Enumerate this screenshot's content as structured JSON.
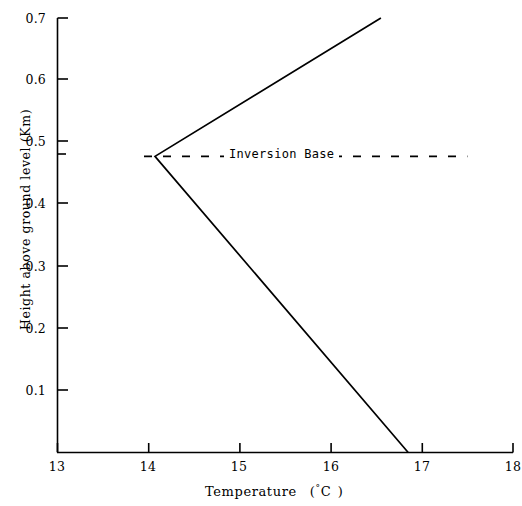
{
  "chart_data": {
    "type": "line",
    "title": "",
    "xlabel": "Temperature  (°C )",
    "ylabel": "Height above ground level (Km)",
    "xlim": [
      13,
      18
    ],
    "ylim": [
      0,
      0.7
    ],
    "grid": false,
    "legend_position": "none",
    "xticks": [
      "13",
      "14",
      "15",
      "16",
      "17",
      "18"
    ],
    "xtick_values": [
      13,
      14,
      15,
      16,
      17,
      18
    ],
    "yticks": [
      "0.1",
      "0.2",
      "0.3",
      "0.4",
      "0.5",
      "0.6",
      "0.7"
    ],
    "ytick_values": [
      0.1,
      0.2,
      0.3,
      0.4,
      0.5,
      0.6,
      0.7
    ],
    "series": [
      {
        "name": "Temperature profile",
        "style": "solid",
        "x": [
          16.85,
          14.07,
          16.55
        ],
        "y": [
          0.0,
          0.477,
          0.7
        ]
      },
      {
        "name": "Inversion Base",
        "style": "dashed",
        "x": [
          13.95,
          17.5
        ],
        "y": [
          0.477,
          0.477
        ]
      }
    ],
    "annotations": [
      {
        "text": "Inversion Base",
        "x": 15.4,
        "y": 0.477
      }
    ],
    "extra_yticks": [
      0.477
    ]
  },
  "axis": {
    "x_title_main": "Temperature",
    "x_title_unit_open": "(",
    "x_title_degree": "°",
    "x_title_c": "C",
    "x_title_unit_close": ")",
    "y_title": "Height above ground level (Km)"
  }
}
